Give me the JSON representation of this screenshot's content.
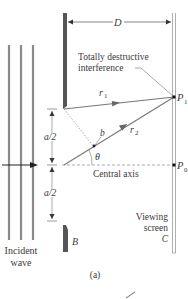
{
  "diagram": {
    "labels": {
      "distance": "D",
      "annotation_line1": "Totally destructive",
      "annotation_line2": "interference",
      "ray1": "r",
      "ray1_sub": "1",
      "ray2": "r",
      "ray2_sub": "2",
      "point1": "P",
      "point1_sub": "1",
      "point0": "P",
      "point0_sub": "0",
      "half_width_top": "a/2",
      "half_width_bottom": "a/2",
      "point_b": "b",
      "angle": "θ",
      "central_axis": "Central axis",
      "barrier": "B",
      "screen_line1": "Viewing",
      "screen_line2": "screen",
      "screen_line3": "C",
      "incident_line1": "Incident",
      "incident_line2": "wave",
      "caption": "(a)"
    },
    "colors": {
      "wavefront": "#8a8a8a",
      "barrier": "#555555",
      "ray": "#777777",
      "text": "#3a3a3a",
      "screen": "#9a9a9a"
    }
  }
}
